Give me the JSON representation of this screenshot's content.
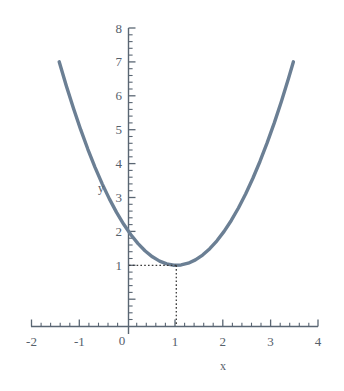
{
  "chart_data": {
    "type": "line",
    "title": "",
    "subtitle": "",
    "xlabel": "x",
    "ylabel": "y",
    "xlim": [
      -2,
      4
    ],
    "ylim": [
      0,
      8
    ],
    "grid": false,
    "legend": null,
    "curve_color": "#6b7f94",
    "axis_color": "#5a6673",
    "guide_color": "#3b3b3b",
    "background": "#ffffff",
    "x_ticks": [
      "-2",
      "-1",
      "0",
      "1",
      "2",
      "3",
      "4"
    ],
    "x_tick_values": [
      -2,
      -1,
      0,
      1,
      2,
      3,
      4
    ],
    "y_ticks": [
      "1",
      "2",
      "3",
      "4",
      "5",
      "6",
      "7",
      "8"
    ],
    "y_tick_values": [
      1,
      2,
      3,
      4,
      5,
      6,
      7,
      8
    ],
    "minor_ticks_per_interval": 5,
    "series": [
      {
        "name": "parabola",
        "equation": "y = x^2 - 2x + 3",
        "x": [
          -1.45,
          -1.3,
          -1.15,
          -1.0,
          -0.85,
          -0.7,
          -0.55,
          -0.4,
          -0.25,
          -0.1,
          0.05,
          0.2,
          0.35,
          0.5,
          0.65,
          0.8,
          0.95,
          1.1,
          1.25,
          1.4,
          1.55,
          1.7,
          1.85,
          2.0,
          2.15,
          2.3,
          2.45,
          2.6,
          2.75,
          2.9,
          3.05,
          3.2,
          3.35,
          3.45
        ],
        "y": [
          8.0025,
          7.29,
          6.6225,
          6.0,
          5.4225,
          4.89,
          4.4025,
          3.96,
          3.5625,
          3.21,
          2.9025,
          2.64,
          2.4225,
          2.25,
          2.1225,
          2.04,
          2.0025,
          2.01,
          2.0625,
          2.16,
          2.3025,
          2.49,
          2.7225,
          3.0,
          3.3225,
          3.69,
          4.1025,
          4.56,
          5.0625,
          5.61,
          6.2025,
          6.84,
          7.5225,
          8.0025
        ]
      }
    ],
    "annotations": [
      {
        "name": "vertex-guide",
        "type": "dotted-crosshair",
        "point": [
          1,
          2
        ],
        "label_x": "1",
        "label_y": "2"
      }
    ]
  },
  "labels": {
    "x_axis_name": "x",
    "y_axis_name": "y",
    "x0": "-2",
    "x1": "-1",
    "x2": "0",
    "x3": "1",
    "x4": "2",
    "x5": "3",
    "x6": "4",
    "y1": "1",
    "y2": "2",
    "y3": "3",
    "y4": "4",
    "y5": "5",
    "y6": "6",
    "y7": "7",
    "y8": "8"
  }
}
